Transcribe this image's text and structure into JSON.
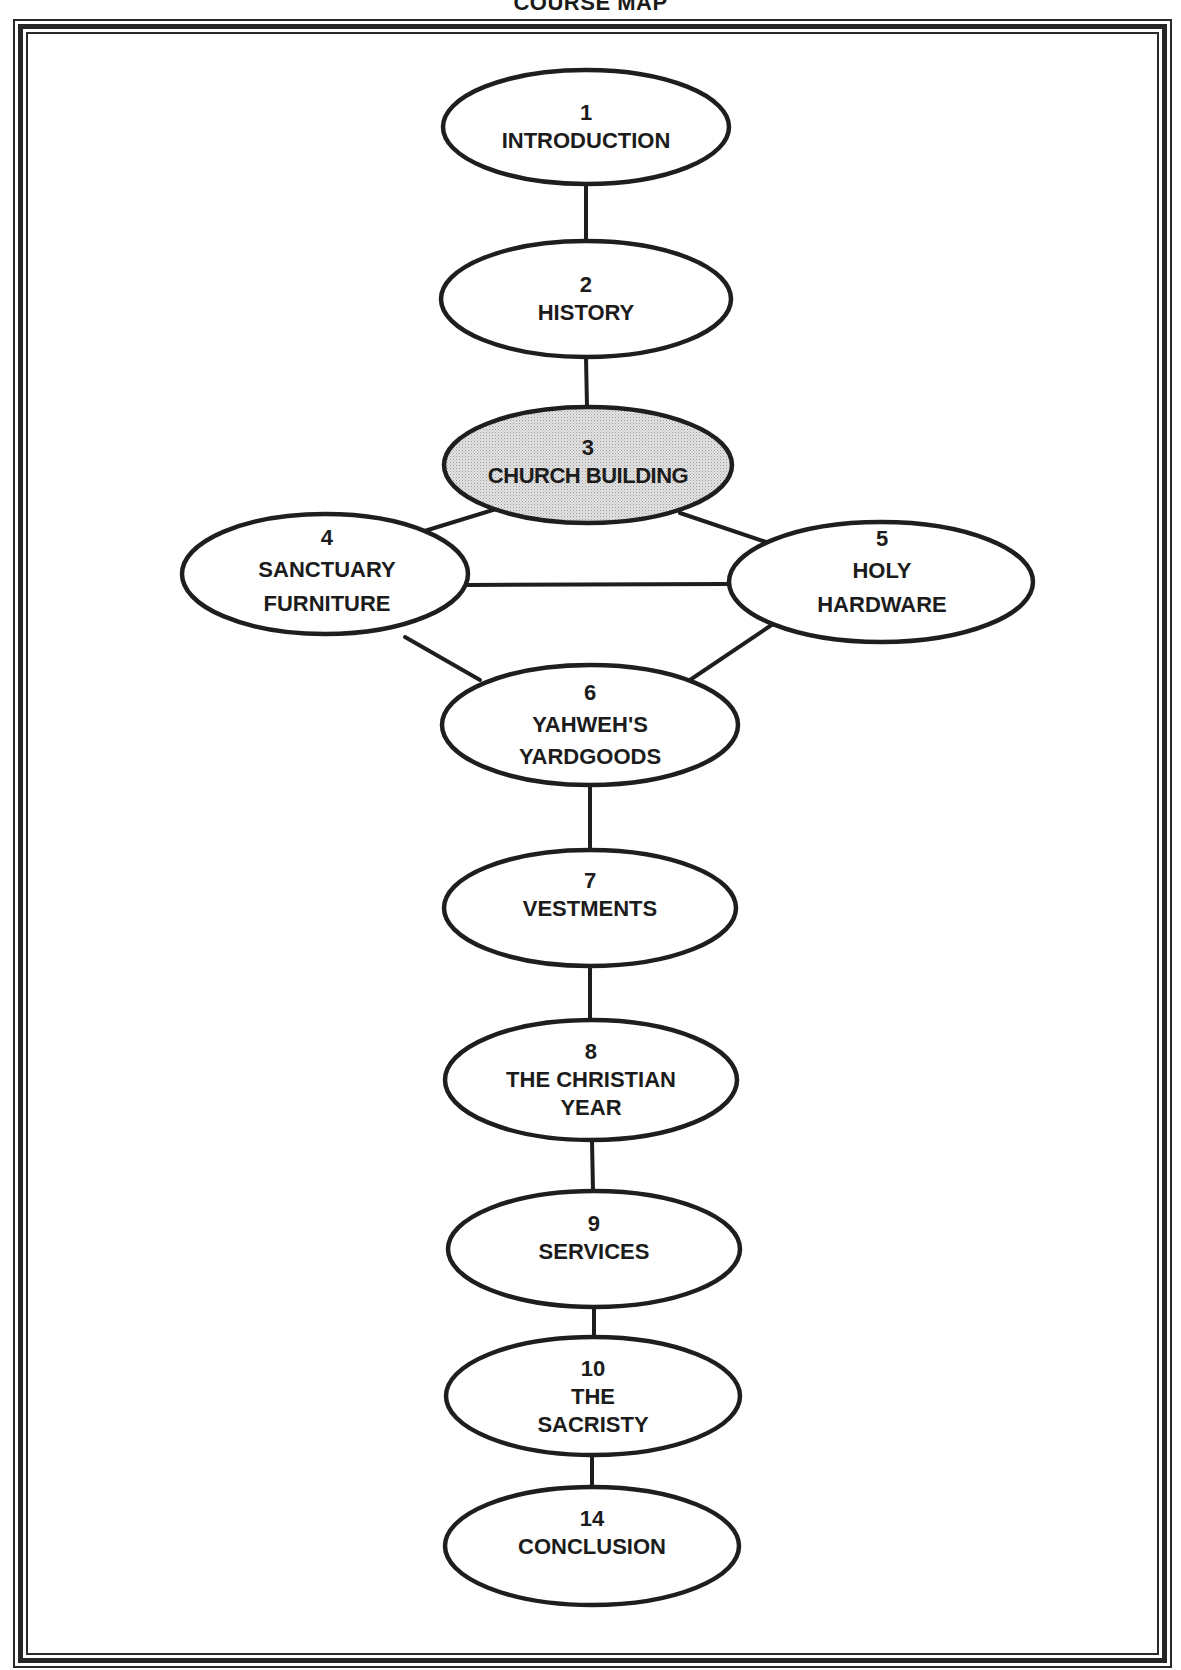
{
  "title": "COURSE MAP",
  "colors": {
    "stroke": "#1e1e1e",
    "highlight_fill": "#d6d6d6",
    "background": "#ffffff"
  },
  "nodes": [
    {
      "id": "n1",
      "number": "1",
      "lines": [
        "INTRODUCTION"
      ],
      "highlighted": false
    },
    {
      "id": "n2",
      "number": "2",
      "lines": [
        "HISTORY"
      ],
      "highlighted": false
    },
    {
      "id": "n3",
      "number": "3",
      "lines": [
        "CHURCH BUILDING"
      ],
      "highlighted": true
    },
    {
      "id": "n4",
      "number": "4",
      "lines": [
        "SANCTUARY",
        "FURNITURE"
      ],
      "highlighted": false
    },
    {
      "id": "n5",
      "number": "5",
      "lines": [
        "HOLY",
        "HARDWARE"
      ],
      "highlighted": false
    },
    {
      "id": "n6",
      "number": "6",
      "lines": [
        "YAHWEH'S",
        "YARDGOODS"
      ],
      "highlighted": false
    },
    {
      "id": "n7",
      "number": "7",
      "lines": [
        "VESTMENTS"
      ],
      "highlighted": false
    },
    {
      "id": "n8",
      "number": "8",
      "lines": [
        "THE CHRISTIAN",
        "YEAR"
      ],
      "highlighted": false
    },
    {
      "id": "n9",
      "number": "9",
      "lines": [
        "SERVICES"
      ],
      "highlighted": false
    },
    {
      "id": "n10",
      "number": "10",
      "lines": [
        "THE",
        "SACRISTY"
      ],
      "highlighted": false
    },
    {
      "id": "n14",
      "number": "14",
      "lines": [
        "CONCLUSION"
      ],
      "highlighted": false
    }
  ],
  "edges": [
    {
      "from": "1",
      "to": "2"
    },
    {
      "from": "2",
      "to": "3"
    },
    {
      "from": "3",
      "to": "4"
    },
    {
      "from": "3",
      "to": "5"
    },
    {
      "from": "4",
      "to": "5"
    },
    {
      "from": "4",
      "to": "6"
    },
    {
      "from": "5",
      "to": "6"
    },
    {
      "from": "6",
      "to": "7"
    },
    {
      "from": "7",
      "to": "8"
    },
    {
      "from": "8",
      "to": "9"
    },
    {
      "from": "9",
      "to": "10"
    },
    {
      "from": "10",
      "to": "14"
    }
  ]
}
